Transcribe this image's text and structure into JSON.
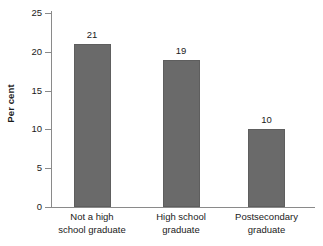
{
  "chart_data": {
    "type": "bar",
    "title": "",
    "subtitle": "",
    "xlabel": "",
    "ylabel": "Per cent",
    "categories": [
      "Not a high school graduate",
      "High school graduate",
      "Postsecondary graduate"
    ],
    "category_lines": [
      [
        "Not a high",
        "school graduate"
      ],
      [
        "High school",
        "graduate"
      ],
      [
        "Postsecondary",
        "graduate"
      ]
    ],
    "values": [
      21,
      19,
      10
    ],
    "value_labels": [
      "21",
      "19",
      "10"
    ],
    "ylim": [
      0,
      25
    ],
    "yticks": [
      0,
      5,
      10,
      15,
      20,
      25
    ],
    "ytick_labels": [
      "0",
      "5",
      "10",
      "15",
      "20",
      "25"
    ],
    "grid": false,
    "legend": false,
    "legend_position": "none",
    "bar_color": "#6a6a6a",
    "axis_color": "#8a8a8a",
    "text_color": "#1a1a1a",
    "background_color": "#ffffff"
  }
}
